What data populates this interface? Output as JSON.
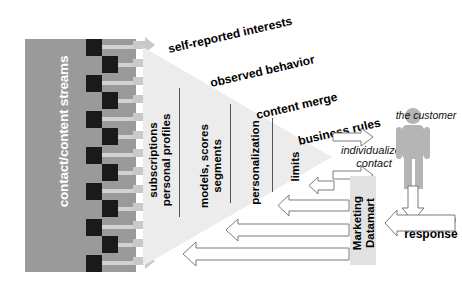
{
  "diagram": {
    "stream_block": {
      "label": "contact/content streams",
      "color": "#9a9a9a",
      "node_color": "#1a1a1a",
      "arrow_color": "#c8c8c8",
      "arrow_count": 12
    },
    "funnel": {
      "fill": "#ececec",
      "stage_labels": [
        {
          "line1": "subscriptions",
          "line2": "personal profiles"
        },
        {
          "line1": "models, scores",
          "line2": "segments"
        },
        {
          "line1": "personalization",
          "line2": ""
        },
        {
          "line1": "limits",
          "line2": ""
        }
      ],
      "input_labels": [
        "self-reported interests",
        "observed behavior",
        "content merge",
        "business rules"
      ]
    },
    "output": {
      "individualized_contact": "individualized contact",
      "customer": "the customer",
      "datamart": {
        "line1": "Marketing",
        "line2": "Datamart"
      },
      "realtime_response": {
        "line1": "real-time",
        "line2": "response"
      }
    }
  }
}
